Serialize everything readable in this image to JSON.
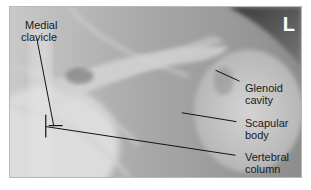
{
  "image": {
    "description": "Shoulder radiograph (scapular Y / oblique view) with anatomical labels",
    "side_marker": "L",
    "labels": [
      {
        "id": "medial-clavicle",
        "line1": "Medial",
        "line2": "clavicle"
      },
      {
        "id": "glenoid-cavity",
        "line1": "Glenoid",
        "line2": "cavity"
      },
      {
        "id": "scapular-body",
        "line1": "Scapular",
        "line2": "body"
      },
      {
        "id": "vertebral-column",
        "line1": "Vertebral",
        "line2": "column"
      }
    ],
    "colors": {
      "label_text": "#1a1a1a",
      "leader_line": "#111111",
      "marker_text": "#ffffff"
    }
  }
}
